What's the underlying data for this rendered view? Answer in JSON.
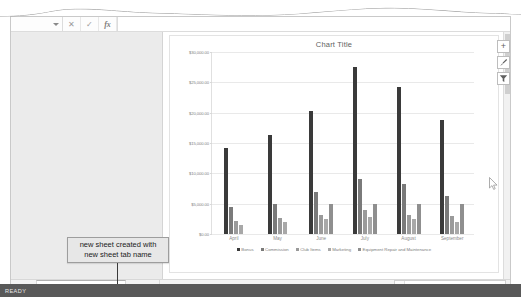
{
  "app": {
    "status_text": "READY"
  },
  "formula_bar": {
    "name_box_value": "",
    "cancel_label": "✕",
    "confirm_label": "✓",
    "fx_label": "fx",
    "input_value": ""
  },
  "annotation": {
    "line1": "new sheet created with",
    "line2": "new sheet tab name"
  },
  "chart_controls": {
    "add_element_label": "+",
    "styles_label": "brush-icon",
    "filters_label": "filter-icon"
  },
  "sheet_tabs": {
    "prev_label": "‹",
    "next_label": "›",
    "add_label": "⊕",
    "tabs": [
      {
        "label": "Clustered Column Chart",
        "active": true
      },
      {
        "label": "Sheet1",
        "active": false
      }
    ]
  },
  "scroll": {
    "left_arrow": "◂"
  },
  "chart_data": {
    "type": "bar",
    "title": "Chart Title",
    "xlabel": "",
    "ylabel": "",
    "ylim": [
      0,
      30000
    ],
    "grid": true,
    "legend_position": "bottom",
    "categories": [
      "April",
      "May",
      "June",
      "July",
      "August",
      "September"
    ],
    "tick_labels": [
      "$0.00",
      "$5,000.00",
      "$10,000.00",
      "$15,000.00",
      "$20,000.00",
      "$25,000.00",
      "$30,000.00"
    ],
    "tick_values": [
      0,
      5000,
      10000,
      15000,
      20000,
      25000,
      30000
    ],
    "series": [
      {
        "name": "Bonus",
        "color": "#3a3a3a",
        "values": [
          14200,
          16300,
          20300,
          27500,
          24200,
          18800
        ]
      },
      {
        "name": "Commission",
        "color": "#7a7a7a",
        "values": [
          4400,
          5000,
          7000,
          9000,
          8200,
          6300
        ]
      },
      {
        "name": "Club Items",
        "color": "#9a9a9a",
        "values": [
          2100,
          2600,
          3200,
          4000,
          3100,
          2900
        ]
      },
      {
        "name": "Marketing",
        "color": "#a8a8a8",
        "values": [
          1500,
          1900,
          2500,
          2800,
          2400,
          1900
        ]
      },
      {
        "name": "Equipment Repair and Maintenance",
        "color": "#8f8f8f",
        "values": [
          0,
          0,
          5000,
          5000,
          5000,
          5000
        ]
      }
    ]
  }
}
